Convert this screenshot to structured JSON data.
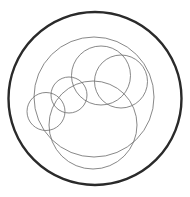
{
  "diagram": {
    "background": "#ffffff",
    "outer_circle": {
      "cx": 95,
      "cy": 98.5,
      "r": 86.5,
      "stroke": "#2a2a2a",
      "stroke_width": 2.4
    },
    "inner_circles": [
      {
        "id": "large-upper",
        "cx": 94,
        "cy": 97,
        "r": 60,
        "stroke": "#6a6a6a",
        "stroke_width": 0.8
      },
      {
        "id": "large-lower",
        "cx": 93,
        "cy": 125,
        "r": 44,
        "stroke": "#6a6a6a",
        "stroke_width": 0.8
      },
      {
        "id": "medium-left",
        "cx": 101,
        "cy": 75.5,
        "r": 29.5,
        "stroke": "#6a6a6a",
        "stroke_width": 0.8
      },
      {
        "id": "medium-right",
        "cx": 121,
        "cy": 81.5,
        "r": 26.5,
        "stroke": "#6a6a6a",
        "stroke_width": 0.8
      },
      {
        "id": "small-middle",
        "cx": 69,
        "cy": 95,
        "r": 18,
        "stroke": "#6a6a6a",
        "stroke_width": 0.8
      },
      {
        "id": "small-left",
        "cx": 46,
        "cy": 111.5,
        "r": 19,
        "stroke": "#6a6a6a",
        "stroke_width": 0.8
      }
    ]
  }
}
